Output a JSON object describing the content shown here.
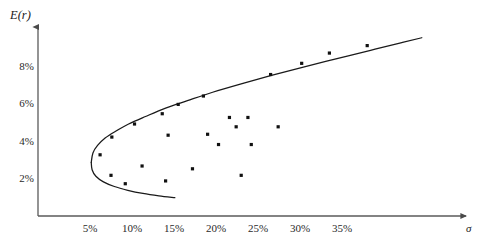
{
  "chart_data": {
    "type": "scatter",
    "title": "",
    "subtitle": "",
    "xlabel": "σ",
    "ylabel": "E(r)",
    "xlim": [
      0,
      42
    ],
    "ylim": [
      0,
      10.6
    ],
    "grid": false,
    "legend": null,
    "axis_style": "arrow-axes",
    "xticks": [
      {
        "value": 5,
        "label": "5%"
      },
      {
        "value": 10,
        "label": "10%"
      },
      {
        "value": 15,
        "label": "15%"
      },
      {
        "value": 20,
        "label": "20%"
      },
      {
        "value": 25,
        "label": "25%"
      },
      {
        "value": 30,
        "label": "30%"
      },
      {
        "value": 35,
        "label": "35%"
      }
    ],
    "yticks": [
      {
        "value": 2,
        "label": "2%"
      },
      {
        "value": 4,
        "label": "4%"
      },
      {
        "value": 6,
        "label": "6%"
      },
      {
        "value": 8,
        "label": "8%"
      }
    ],
    "series": [
      {
        "name": "assets",
        "type": "scatter",
        "marker": "square-dot",
        "color": "#111111",
        "points": [
          {
            "x": 6.2,
            "y": 3.35
          },
          {
            "x": 7.6,
            "y": 4.3
          },
          {
            "x": 7.5,
            "y": 2.25
          },
          {
            "x": 9.2,
            "y": 1.8
          },
          {
            "x": 10.3,
            "y": 5.0
          },
          {
            "x": 11.2,
            "y": 2.75
          },
          {
            "x": 13.6,
            "y": 5.55
          },
          {
            "x": 14.3,
            "y": 4.4
          },
          {
            "x": 14.0,
            "y": 1.95
          },
          {
            "x": 15.5,
            "y": 6.05
          },
          {
            "x": 17.2,
            "y": 2.6
          },
          {
            "x": 18.5,
            "y": 6.5
          },
          {
            "x": 19.0,
            "y": 4.45
          },
          {
            "x": 20.3,
            "y": 3.9
          },
          {
            "x": 21.6,
            "y": 5.35
          },
          {
            "x": 22.4,
            "y": 4.85
          },
          {
            "x": 23.0,
            "y": 2.25
          },
          {
            "x": 23.8,
            "y": 5.35
          },
          {
            "x": 24.2,
            "y": 3.9
          },
          {
            "x": 27.4,
            "y": 4.85
          },
          {
            "x": 26.5,
            "y": 7.65
          },
          {
            "x": 30.2,
            "y": 8.25
          },
          {
            "x": 33.5,
            "y": 8.8
          },
          {
            "x": 38.0,
            "y": 9.2
          }
        ]
      }
    ],
    "curves": [
      {
        "name": "efficient-frontier-upper",
        "description": "upper branch of the minimum-variance frontier",
        "color": "#1a1a1a",
        "points": [
          {
            "x": 5.15,
            "y": 2.95
          },
          {
            "x": 5.35,
            "y": 3.45
          },
          {
            "x": 5.9,
            "y": 3.85
          },
          {
            "x": 6.8,
            "y": 4.25
          },
          {
            "x": 8.0,
            "y": 4.6
          },
          {
            "x": 9.6,
            "y": 5.0
          },
          {
            "x": 11.6,
            "y": 5.4
          },
          {
            "x": 14.0,
            "y": 5.85
          },
          {
            "x": 16.6,
            "y": 6.25
          },
          {
            "x": 19.6,
            "y": 6.7
          },
          {
            "x": 23.0,
            "y": 7.15
          },
          {
            "x": 26.6,
            "y": 7.6
          },
          {
            "x": 30.4,
            "y": 8.05
          },
          {
            "x": 34.4,
            "y": 8.5
          },
          {
            "x": 38.4,
            "y": 8.95
          },
          {
            "x": 42.0,
            "y": 9.35
          },
          {
            "x": 44.5,
            "y": 9.62
          }
        ]
      },
      {
        "name": "frontier-lower",
        "description": "lower (inefficient) branch of the minimum-variance frontier",
        "color": "#1a1a1a",
        "points": [
          {
            "x": 5.15,
            "y": 2.95
          },
          {
            "x": 5.25,
            "y": 2.55
          },
          {
            "x": 5.7,
            "y": 2.2
          },
          {
            "x": 6.6,
            "y": 1.9
          },
          {
            "x": 7.9,
            "y": 1.65
          },
          {
            "x": 9.5,
            "y": 1.45
          },
          {
            "x": 11.3,
            "y": 1.28
          },
          {
            "x": 13.2,
            "y": 1.15
          },
          {
            "x": 15.1,
            "y": 1.05
          }
        ]
      }
    ],
    "annotations": []
  }
}
